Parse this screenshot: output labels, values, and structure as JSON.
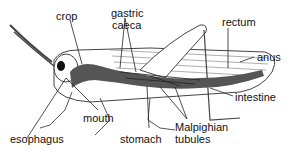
{
  "diagram": {
    "labels": {
      "crop": "crop",
      "gastric_caeca_1": "gastric",
      "gastric_caeca_2": "caeca",
      "rectum": "rectum",
      "anus": "anus",
      "intestine": "intestine",
      "esophagus": "esophagus",
      "mouth": "mouth",
      "stomach": "stomach",
      "malpighian_1": "Malpighian",
      "malpighian_2": "tubules"
    },
    "colors": {
      "outline": "#333333",
      "gut": "#555555",
      "background": "#ffffff"
    }
  }
}
